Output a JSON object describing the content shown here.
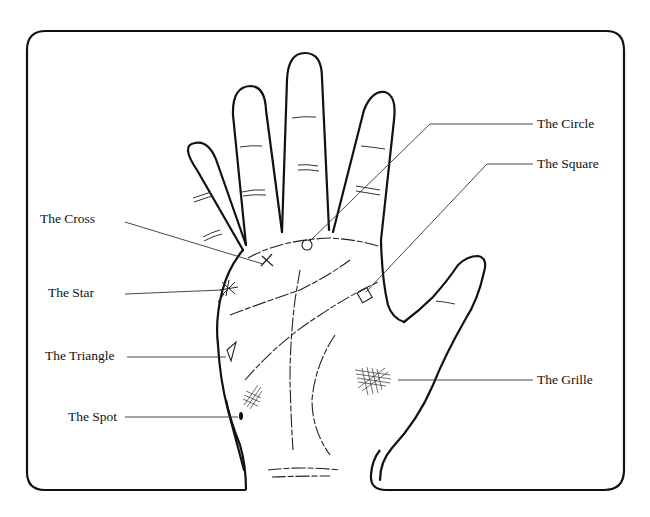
{
  "diagram": {
    "labels": {
      "cross": "The Cross",
      "star": "The Star",
      "triangle": "The Triangle",
      "spot": "The Spot",
      "circle": "The Circle",
      "square": "The Square",
      "grille": "The Grille"
    },
    "colors": {
      "ink": "#111111",
      "background": "#ffffff",
      "leader_line": "#333333"
    }
  }
}
